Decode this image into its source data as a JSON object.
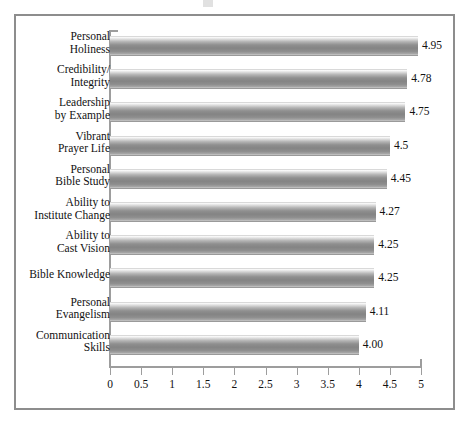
{
  "figure": {
    "frame_color": "#8d8d8d",
    "background": "#ffffff",
    "bar_color": "#8f8f8f",
    "axis_color": "#9d9d9d"
  },
  "chart_data": {
    "type": "bar",
    "orientation": "horizontal",
    "title": "",
    "subtitle": "",
    "xlabel": "",
    "ylabel": "",
    "xlim": [
      0,
      5
    ],
    "grid": false,
    "legend": null,
    "tick_step": 0.5,
    "xticks": [
      0,
      0.5,
      1,
      1.5,
      2,
      2.5,
      3,
      3.5,
      4,
      4.5,
      5
    ],
    "xtick_labels": [
      "0",
      "0.5",
      "1",
      "1.5",
      "2",
      "2.5",
      "3",
      "3.5",
      "4",
      "4.5",
      "5"
    ],
    "categories": [
      "Personal\nHoliness",
      "Credibility/\nIntegrity",
      "Leadership\nby Example",
      "Vibrant\nPrayer Life",
      "Personal\nBible Study",
      "Ability to\nInstitute Change",
      "Ability to\nCast Vision",
      "Bible Knowledge",
      "Personal\nEvangelism",
      "Communication\nSkills"
    ],
    "values": [
      4.95,
      4.78,
      4.75,
      4.5,
      4.45,
      4.27,
      4.25,
      4.25,
      4.11,
      4.0
    ],
    "value_labels": [
      "4.95",
      "4.78",
      "4.75",
      "4.5",
      "4.45",
      "4.27",
      "4.25",
      "4.25",
      "4.11",
      "4.00"
    ]
  }
}
